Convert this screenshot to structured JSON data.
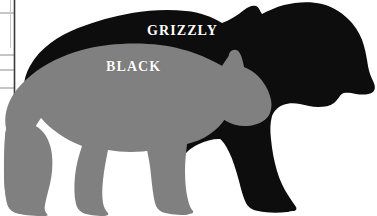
{
  "figure": {
    "type": "comparison-silhouette",
    "background_color": "#ffffff"
  },
  "labels": {
    "grizzly": "GRIZZLY",
    "black": "BLACK"
  },
  "silhouettes": {
    "grizzly": {
      "name": "grizzly-bear-silhouette",
      "color": "#0d0d0d",
      "label": "GRIZZLY"
    },
    "black": {
      "name": "black-bear-silhouette",
      "color": "#808080",
      "label": "BLACK"
    }
  },
  "ruler": {
    "name": "scale-ruler",
    "line_color": "#3a3a3a",
    "tick_color": "#8c8c8c",
    "axis_x": 14,
    "ticks": [
      13,
      55,
      70,
      88
    ]
  }
}
